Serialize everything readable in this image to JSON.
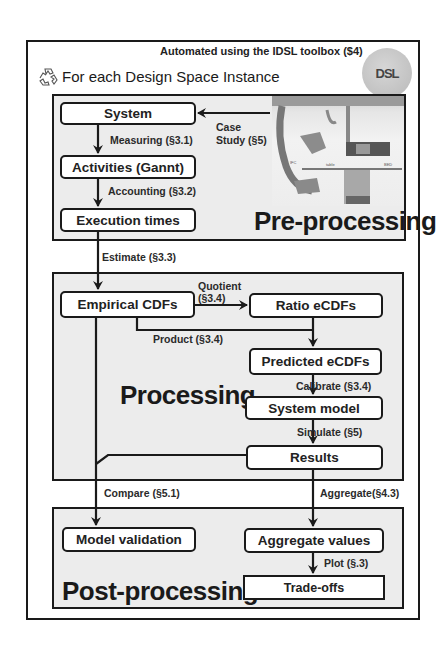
{
  "header": {
    "automation_note": "Automated using the IDSL toolbox ($4)",
    "loop_title": "For each Design Space Instance",
    "loop_icon": "recycle-icon",
    "logo_text": "DSL"
  },
  "sections": {
    "preprocessing": "Pre-processing",
    "processing": "Processing",
    "postprocessing": "Post-processing"
  },
  "nodes": {
    "system": "System",
    "activities": "Activities (Gannt)",
    "execution_times": "Execution times",
    "empirical_cdfs": "Empirical CDFs",
    "ratio_ecdfs": "Ratio eCDFs",
    "predicted_ecdfs": "Predicted eCDFs",
    "system_model": "System model",
    "results": "Results",
    "model_validation": "Model validation",
    "aggregate_values": "Aggregate values",
    "trade_offs": "Trade-offs"
  },
  "edges": {
    "case_study_1": "Case",
    "case_study_2": "Study (§5)",
    "measuring": "Measuring (§3.1)",
    "accounting": "Accounting (§3.2)",
    "estimate": "Estimate (§3.3)",
    "quotient_1": "Quotient",
    "quotient_2": "(§3.4)",
    "product": "Product (§3.4)",
    "calibrate": "Calibrate (§3.4)",
    "simulate": "Simulate (§5)",
    "compare": "Compare (§5.1)",
    "aggregate": "Aggregate(§4.3)",
    "plot": "Plot (§.3)"
  },
  "photo": {
    "description": "Case study system photo (interventional X-ray)",
    "labels": [
      "IFC",
      "table",
      "BED"
    ]
  },
  "colors": {
    "line": "#1a1a1a",
    "panel_fill": "#ececec",
    "node_fill": "#ffffff"
  }
}
